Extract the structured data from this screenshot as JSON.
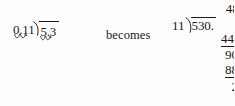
{
  "figure": {
    "kind": "long-division-illustration",
    "ink_color": "#1a1a1a",
    "background_color": "#fdfdfd"
  },
  "left_expression": {
    "label": "original decimal division",
    "divisor": "0.11",
    "dividend": "5.3",
    "divisor_shift_marks": 2,
    "dividend_shift_marks": 2,
    "shift_mark_name": "decimal-shift-arc"
  },
  "connector": {
    "text": "becomes"
  },
  "long_division": {
    "label": "equivalent whole-number division",
    "quotient": "48.",
    "divisor": "11",
    "dividend": "530.",
    "steps": [
      {
        "name": "subtract-1",
        "value": "44",
        "underlined": true
      },
      {
        "name": "remainder-1",
        "value": "90",
        "underlined": false
      },
      {
        "name": "subtract-2",
        "value": "88",
        "underlined": true
      },
      {
        "name": "remainder-final",
        "value": "2",
        "underlined": false
      }
    ],
    "bring_down_arrow": "down-arrow"
  }
}
